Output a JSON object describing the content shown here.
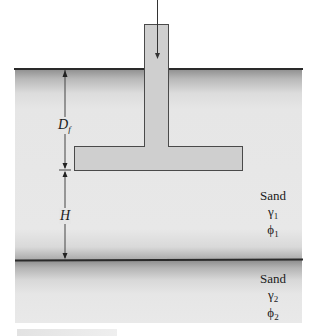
{
  "diagram": {
    "type": "shallow foundation on layered soil",
    "footing": {
      "shape": "inverted-T footing (column with spread base)",
      "fill_color": "#cfcfcf",
      "outline_color": "#4a4a4a"
    },
    "load": {
      "direction": "down",
      "description": "vertical load arrow on column"
    },
    "dimensions": [
      {
        "symbol": "D",
        "subscript": "f",
        "meaning": "depth from ground surface to footing base"
      },
      {
        "symbol": "H",
        "subscript": "",
        "meaning": "distance from footing base to lower layer boundary"
      }
    ],
    "layers": [
      {
        "name": "Sand",
        "unit_weight": "γ",
        "unit_weight_sub": "1",
        "friction_angle": "ϕ",
        "friction_angle_sub": "1"
      },
      {
        "name": "Sand",
        "unit_weight": "γ",
        "unit_weight_sub": "2",
        "friction_angle": "ϕ",
        "friction_angle_sub": "2"
      }
    ],
    "soil_color": "#e6e6e6",
    "line_color": "#2a2a2a"
  }
}
